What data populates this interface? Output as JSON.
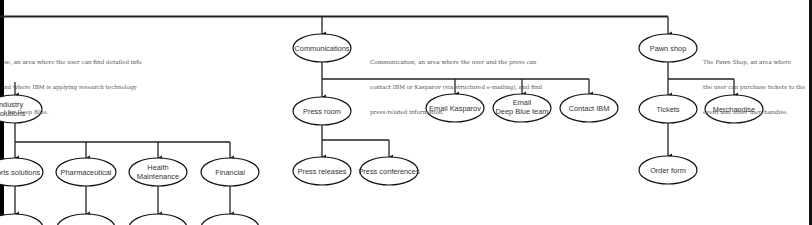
{
  "diagram": {
    "type": "site-map hierarchy",
    "nodes": [
      {
        "id": "industry",
        "label_lines": [
          "Industry",
          "Solutions"
        ],
        "cx": 16,
        "cy": 109
      },
      {
        "id": "sports",
        "label_lines": [
          "Sports solutions"
        ],
        "cx": 15,
        "cy": 172
      },
      {
        "id": "pharma",
        "label_lines": [
          "Pharmaceutical"
        ],
        "cx": 86,
        "cy": 172
      },
      {
        "id": "health",
        "label_lines": [
          "Health",
          "Maintenance"
        ],
        "cx": 158,
        "cy": 172
      },
      {
        "id": "financial",
        "label_lines": [
          "Financial"
        ],
        "cx": 230,
        "cy": 172
      },
      {
        "id": "communications",
        "label_lines": [
          "Communications"
        ],
        "cx": 322,
        "cy": 48
      },
      {
        "id": "press_room",
        "label_lines": [
          "Press room"
        ],
        "cx": 322,
        "cy": 111
      },
      {
        "id": "press_releases",
        "label_lines": [
          "Press releases"
        ],
        "cx": 322,
        "cy": 171
      },
      {
        "id": "press_conferences",
        "label_lines": [
          "Press conferences"
        ],
        "cx": 389,
        "cy": 171
      },
      {
        "id": "email_kasparov",
        "label_lines": [
          "Email Kasparov"
        ],
        "cx": 455,
        "cy": 108
      },
      {
        "id": "email_deep_blue",
        "label_lines": [
          "Email",
          "Deep Blue team"
        ],
        "cx": 522,
        "cy": 108
      },
      {
        "id": "contact_ibm",
        "label_lines": [
          "Contact IBM"
        ],
        "cx": 589,
        "cy": 108
      },
      {
        "id": "pawn_shop",
        "label_lines": [
          "Pawn shop"
        ],
        "cx": 668,
        "cy": 48
      },
      {
        "id": "tickets",
        "label_lines": [
          "Tickets"
        ],
        "cx": 668,
        "cy": 109
      },
      {
        "id": "merchandise",
        "label_lines": [
          "Merchandise"
        ],
        "cx": 734,
        "cy": 109
      },
      {
        "id": "order_form",
        "label_lines": [
          "Order form"
        ],
        "cx": 668,
        "cy": 170
      }
    ],
    "descriptions": {
      "research": [
        "se, an area where the user can find detailed info",
        "nd where IBM is applying research technology",
        "l for Deep Blue."
      ],
      "communications": [
        "Communication, an area where the user and the press can",
        "contact IBM or Kasparov (via structured e-mailing), and find",
        "press-related information."
      ],
      "pawn_shop": [
        "The Pawn Shop, an area where",
        "the user can purchase tickets to the",
        "event and other merchandise."
      ]
    }
  }
}
